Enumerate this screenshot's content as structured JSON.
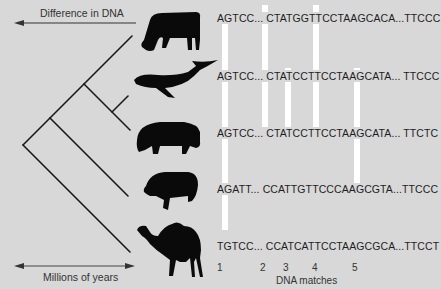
{
  "diagram": {
    "top_arrow_label": "Difference in DNA",
    "bottom_arrow_label": "Millions of years",
    "x_axis_label": "DNA matches",
    "colors": {
      "background": "#d8d8d8",
      "lines": "#1a1a1a",
      "match_bars": "#ffffff",
      "silhouettes": "#0a0a0a"
    },
    "animals": [
      {
        "name": "cow",
        "sequence": "AGTCC... CTATGGTTCCTAAGCACA...TTCCC"
      },
      {
        "name": "whale",
        "sequence": "AGTCC... CTATCCTTCCTAAGCATA... TTCCC"
      },
      {
        "name": "hippopotamus",
        "sequence": "AGTCC... CTATCCTTCCTAAGCATA... TTCTC"
      },
      {
        "name": "pig",
        "sequence": "AGATT... CCATTGTTCCCAAGCGTA...TTCCC"
      },
      {
        "name": "camel",
        "sequence": "TGTCC... CCATCATTCCTAAGCGCA...TTCCT"
      }
    ],
    "match_numbers": [
      "1",
      "2",
      "3",
      "4",
      "5"
    ],
    "match_bars": [
      {
        "id": "1",
        "spans": "cow-pig"
      },
      {
        "id": "2",
        "spans": "cow-hippopotamus"
      },
      {
        "id": "3",
        "spans": "whale-hippopotamus"
      },
      {
        "id": "4",
        "spans": "cow-hippopotamus"
      },
      {
        "id": "5",
        "spans": "whale-pig"
      }
    ],
    "tree": "((((whale,hippopotamus),cow),pig),camel)"
  }
}
